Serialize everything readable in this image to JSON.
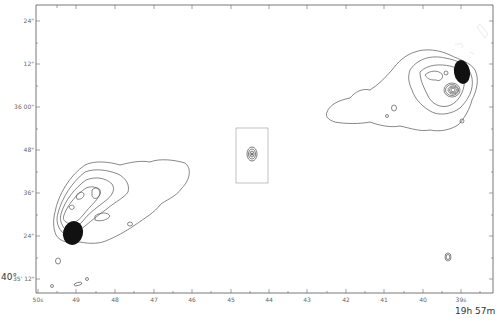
{
  "figure": {
    "type": "radio contour map",
    "axes": {
      "y_labels": [
        {
          "text": "24\"",
          "y": 21
        },
        {
          "text": "12\"",
          "y": 64
        },
        {
          "text": "36 00\"",
          "y": 107
        },
        {
          "text": "48\"",
          "y": 150
        },
        {
          "text": "36\"",
          "y": 193
        },
        {
          "text": "24\"",
          "y": 236
        }
      ],
      "y_origin_prefix": "40°",
      "y_origin_label": "35' 12\"",
      "x_labels": [
        {
          "text": "50s",
          "x": 38
        },
        {
          "text": "49",
          "x": 76
        },
        {
          "text": "48",
          "x": 115
        },
        {
          "text": "47",
          "x": 154
        },
        {
          "text": "46",
          "x": 192
        },
        {
          "text": "45",
          "x": 231
        },
        {
          "text": "44",
          "x": 269
        },
        {
          "text": "43",
          "x": 307
        },
        {
          "text": "42",
          "x": 346
        },
        {
          "text": "41",
          "x": 384
        },
        {
          "text": "40",
          "x": 423
        },
        {
          "text": "39s",
          "x": 461
        }
      ],
      "x_origin_label": "19h 57m"
    },
    "features": {
      "west_lobe": "Extended contour lobe with dark hotspot (lower left)",
      "core": "Compact nucleus inside inset box (center)",
      "east_lobe": "Extended contour lobe with dark hotspot (upper right)"
    }
  }
}
